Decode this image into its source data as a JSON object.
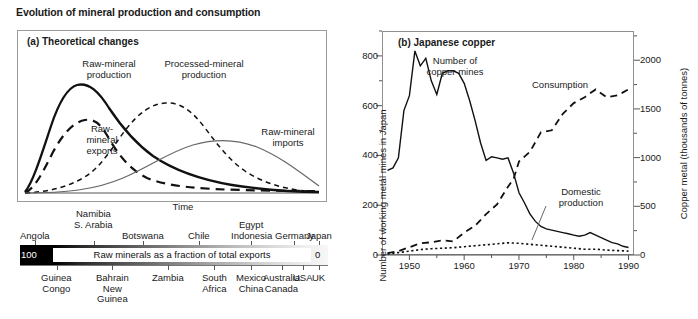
{
  "figure": {
    "title": "Evolution of mineral production and consumption"
  },
  "panel_a": {
    "title": "(a) Theoretical changes",
    "xlabel": "Time",
    "curve_labels": {
      "raw_production": "Raw-mineral\nproduction",
      "processed_production": "Processed-mineral\nproduction",
      "raw_exports": "Raw-\nmineral\nexports",
      "raw_imports": "Raw-mineral\nimports"
    }
  },
  "scale": {
    "caption": "Raw minerals as a fraction of total exports",
    "left_value": "100",
    "right_value": "0",
    "top_countries": [
      {
        "label": "Angola",
        "pos": 5,
        "row": 2
      },
      {
        "label": "Namibia",
        "pos": 24,
        "row": 0
      },
      {
        "label": "S. Arabia",
        "pos": 24,
        "row": 1
      },
      {
        "label": "Botswana",
        "pos": 40,
        "row": 2
      },
      {
        "label": "Chile",
        "pos": 58,
        "row": 2
      },
      {
        "label": "Egypt",
        "pos": 75,
        "row": 1
      },
      {
        "label": "Indonesia",
        "pos": 75,
        "row": 2
      },
      {
        "label": "Germany",
        "pos": 89,
        "row": 2
      },
      {
        "label": "Japan",
        "pos": 97,
        "row": 2
      }
    ],
    "bottom_countries": [
      {
        "label": "Guinea\nCongo",
        "pos": 12
      },
      {
        "label": "Bahrain\nNew\nGuinea",
        "pos": 30
      },
      {
        "label": "Zambia",
        "pos": 48
      },
      {
        "label": "South\nAfrica",
        "pos": 63
      },
      {
        "label": "Mexico\nChina",
        "pos": 75
      },
      {
        "label": "Australia\nCanada",
        "pos": 85
      },
      {
        "label": "USA",
        "pos": 92
      },
      {
        "label": "UK",
        "pos": 97
      }
    ]
  },
  "panel_b": {
    "title": "(b) Japanese copper",
    "y_left_label": "Number of working metal mines in Japan",
    "y_right_label": "Copper metal (thousands of tonnes)",
    "series_labels": {
      "mines": "Number of\ncopper mines",
      "consumption": "Consumption",
      "domestic": "Domestic\nproduction"
    }
  },
  "chart_data": [
    {
      "type": "line",
      "title": "(a) Theoretical changes",
      "xlabel": "Time",
      "ylabel": "",
      "grid": false,
      "legend": "inline annotations",
      "note": "Schematic idealised curves, no numeric axes",
      "xlim": [
        0,
        100
      ],
      "ylim": [
        0,
        100
      ],
      "series": [
        {
          "name": "Raw-mineral production",
          "style": "solid-thick",
          "x": [
            0,
            4,
            8,
            12,
            17,
            22,
            27,
            33,
            40,
            48,
            57,
            66,
            75,
            84,
            92,
            100
          ],
          "y": [
            2,
            10,
            30,
            55,
            74,
            84,
            86,
            83,
            74,
            63,
            52,
            41,
            31,
            23,
            16,
            11
          ]
        },
        {
          "name": "Raw-mineral exports",
          "style": "dashed-thick",
          "x": [
            0,
            5,
            10,
            16,
            22,
            27,
            31,
            36,
            41,
            47,
            55,
            65,
            75,
            85,
            95,
            100
          ],
          "y": [
            1,
            8,
            24,
            45,
            60,
            65,
            62,
            52,
            40,
            28,
            19,
            12,
            8,
            6,
            5,
            5
          ]
        },
        {
          "name": "Processed-mineral production",
          "style": "dashed-thin",
          "x": [
            0,
            8,
            16,
            24,
            31,
            38,
            45,
            52,
            58,
            64,
            71,
            78,
            85,
            92,
            100
          ],
          "y": [
            1,
            3,
            8,
            18,
            34,
            54,
            68,
            72,
            70,
            62,
            50,
            38,
            27,
            19,
            13
          ]
        },
        {
          "name": "Raw-mineral imports",
          "style": "solid-thin",
          "x": [
            0,
            12,
            24,
            34,
            43,
            51,
            59,
            67,
            75,
            82,
            89,
            95,
            100
          ],
          "y": [
            0,
            1,
            3,
            7,
            14,
            22,
            31,
            39,
            44,
            45,
            43,
            39,
            34
          ]
        }
      ]
    },
    {
      "type": "line",
      "title": "(b) Japanese copper",
      "xlabel": "",
      "xlim": [
        1945,
        1991
      ],
      "xticks": [
        1950,
        1960,
        1970,
        1980,
        1990
      ],
      "xminorticks": [
        1945,
        1955,
        1965,
        1975,
        1985,
        1990
      ],
      "y_left": {
        "label": "Number of working metal mines in Japan",
        "ticks": [
          0,
          200,
          400,
          600,
          800
        ],
        "minor_ticks": [
          100,
          300,
          500,
          700,
          900
        ],
        "lim": [
          0,
          900
        ]
      },
      "y_right": {
        "label": "Copper metal (thousands of tonnes)",
        "ticks": [
          0,
          500,
          1000,
          1500,
          2000
        ],
        "minor_ticks": [
          250,
          750,
          1250,
          1750,
          2250
        ],
        "lim": [
          0,
          2300
        ]
      },
      "grid": false,
      "series": [
        {
          "name": "Number of copper mines",
          "style": "solid",
          "axis": "left",
          "units": "mines",
          "x": [
            1946,
            1947,
            1948,
            1949,
            1950,
            1951,
            1952,
            1953,
            1954,
            1955,
            1956,
            1957,
            1958,
            1959,
            1960,
            1961,
            1962,
            1963,
            1964,
            1965,
            1966,
            1967,
            1968,
            1969,
            1970,
            1971,
            1972,
            1973,
            1974,
            1975,
            1976,
            1977,
            1978,
            1979,
            1980,
            1981,
            1982,
            1983,
            1984,
            1985,
            1986,
            1987,
            1988,
            1989,
            1990
          ],
          "y": [
            340,
            350,
            390,
            580,
            640,
            820,
            760,
            790,
            700,
            645,
            730,
            740,
            740,
            730,
            690,
            620,
            540,
            450,
            380,
            395,
            390,
            385,
            390,
            330,
            250,
            210,
            165,
            135,
            115,
            105,
            100,
            95,
            90,
            85,
            80,
            75,
            80,
            90,
            80,
            70,
            60,
            50,
            45,
            35,
            30
          ]
        },
        {
          "name": "Consumption",
          "style": "dashed",
          "axis": "right",
          "units": "thousand tonnes",
          "x": [
            1946,
            1948,
            1950,
            1952,
            1954,
            1956,
            1958,
            1960,
            1962,
            1964,
            1966,
            1968,
            1969,
            1970,
            1972,
            1974,
            1976,
            1978,
            1980,
            1982,
            1984,
            1986,
            1988,
            1990
          ],
          "y": [
            20,
            40,
            80,
            120,
            130,
            150,
            140,
            230,
            300,
            420,
            520,
            700,
            780,
            960,
            1060,
            1260,
            1280,
            1450,
            1560,
            1620,
            1700,
            1620,
            1640,
            1700
          ]
        },
        {
          "name": "Domestic production",
          "style": "dotted",
          "axis": "right",
          "units": "thousand tonnes",
          "x": [
            1946,
            1948,
            1950,
            1952,
            1954,
            1956,
            1958,
            1960,
            1962,
            1964,
            1966,
            1968,
            1970,
            1972,
            1974,
            1976,
            1978,
            1980,
            1982,
            1984,
            1986,
            1988,
            1990
          ],
          "y": [
            10,
            25,
            40,
            55,
            65,
            70,
            75,
            85,
            95,
            105,
            115,
            125,
            120,
            110,
            100,
            90,
            80,
            70,
            60,
            60,
            50,
            45,
            40
          ]
        }
      ]
    }
  ]
}
